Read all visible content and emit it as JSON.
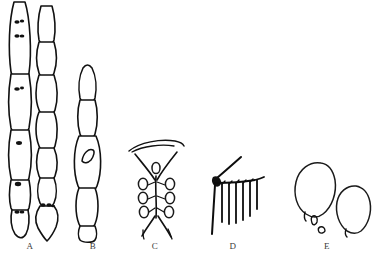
{
  "plate": {
    "title": "Comparative morphology plate",
    "background_color": "#ffffff",
    "ink_color": "#111111",
    "width": 379,
    "height": 262,
    "medium": "ink line drawing",
    "style": "scientific illustration"
  },
  "figures": [
    {
      "id": "A",
      "label": "A",
      "label_x": 30,
      "label_y": 245,
      "caption": "Two multicellular septate filaments (chains of cells) bearing dark internal granules; right filament terminates in a pointed foot cell",
      "element_count": 2,
      "cell_count_left": 6,
      "cell_count_right": 8,
      "has_dark_granules": true
    },
    {
      "id": "B",
      "label": "B",
      "label_x": 93,
      "label_y": 245,
      "caption": "Single elongate septate filament of five cells, the third cell enlarged and bearing a lateral lens-shaped inclusion; truncate basal cell",
      "element_count": 1,
      "cell_count": 5,
      "has_dark_granules": false
    },
    {
      "id": "C",
      "label": "C",
      "label_x": 155,
      "label_y": 245,
      "caption": "Branched conidiophore beneath an arched cap, bearing paired rows of ovoid conidia along the axis, with divergent basal branches",
      "element_count": 1,
      "spore_count": 7,
      "has_arched_cap": true
    },
    {
      "id": "D",
      "label": "D",
      "label_x": 233,
      "label_y": 245,
      "caption": "Fertile hypha bearing a comb-like row of parallel downward-directed phialides",
      "element_count": 1,
      "phialide_count": 6,
      "has_dark_granules": true
    },
    {
      "id": "E",
      "label": "E",
      "label_x": 327,
      "label_y": 245,
      "caption": "Two large ovoid to pyriform spores with apiculate bases, accompanied by two small detached fragments",
      "element_count": 2,
      "fragment_count": 2,
      "has_dark_granules": false
    }
  ]
}
